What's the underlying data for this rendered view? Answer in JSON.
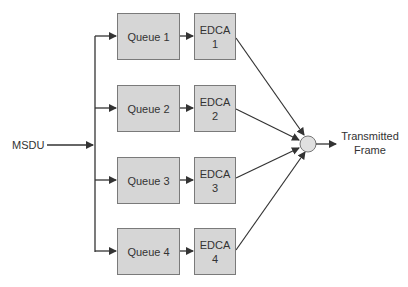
{
  "diagram": {
    "input_label": "MSDU",
    "output_label_line1": "Transmitted",
    "output_label_line2": "Frame",
    "queues": [
      {
        "label": "Queue 1",
        "edca_line1": "EDCA",
        "edca_line2": "1"
      },
      {
        "label": "Queue 2",
        "edca_line1": "EDCA",
        "edca_line2": "2"
      },
      {
        "label": "Queue 3",
        "edca_line1": "EDCA",
        "edca_line2": "3"
      },
      {
        "label": "Queue 4",
        "edca_line1": "EDCA",
        "edca_line2": "4"
      }
    ],
    "colors": {
      "box_fill": "#d6d6d6",
      "box_border": "#7a7a7a",
      "line": "#333333",
      "merge_node": "#e0e0e0"
    }
  }
}
